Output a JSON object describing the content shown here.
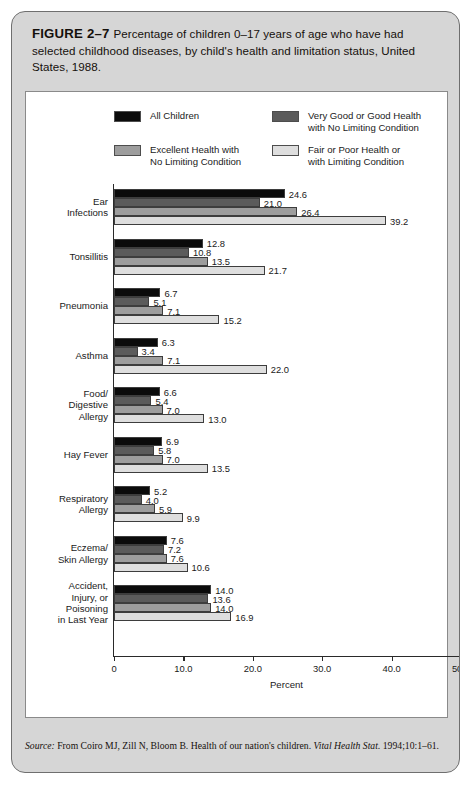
{
  "figure": {
    "number": "FIGURE 2–7",
    "caption": "Percentage of children 0–17 years of age who have had selected childhood diseases, by child's health and limitation status, United States, 1988."
  },
  "source": {
    "label": "Source:",
    "text_before": " From Coiro MJ, Zill N, Bloom B. Health of our nation's children. ",
    "journal": "Vital Health Stat.",
    "text_after": " 1994;10:1–61."
  },
  "chart_data": {
    "type": "bar",
    "orientation": "horizontal",
    "title": "",
    "xlabel": "Percent",
    "ylabel": "",
    "xlim": [
      0,
      50
    ],
    "xticks": [
      "0",
      "10.0",
      "20.0",
      "30.0",
      "40.0",
      "50.0"
    ],
    "xtick_values": [
      0,
      10,
      20,
      30,
      40,
      50
    ],
    "grid": false,
    "legend_position": "top",
    "categories": [
      "Ear Infections",
      "Tonsillitis",
      "Pneumonia",
      "Asthma",
      "Food/ Digestive Allergy",
      "Hay Fever",
      "Respiratory Allergy",
      "Eczema/ Skin Allergy",
      "Accident, Injury, or Poisoning in Last Year"
    ],
    "category_lines": [
      [
        "Ear",
        "Infections"
      ],
      [
        "Tonsillitis"
      ],
      [
        "Pneumonia"
      ],
      [
        "Asthma"
      ],
      [
        "Food/",
        "Digestive",
        "Allergy"
      ],
      [
        "Hay Fever"
      ],
      [
        "Respiratory",
        "Allergy"
      ],
      [
        "Eczema/",
        "Skin Allergy"
      ],
      [
        "Accident,",
        "Injury, or",
        "Poisoning",
        "in Last Year"
      ]
    ],
    "series": [
      {
        "name": "All Children",
        "color": "#0b0b0b",
        "values": [
          24.6,
          12.8,
          6.7,
          6.3,
          6.6,
          6.9,
          5.2,
          7.6,
          14.0
        ],
        "labels": [
          "24.6",
          "12.8",
          "6.7",
          "6.3",
          "6.6",
          "6.9",
          "5.2",
          "7.6",
          "14.0"
        ]
      },
      {
        "name": "Very Good or Good Health with No Limiting Condition",
        "color": "#5b5b5b",
        "values": [
          21.0,
          10.8,
          5.1,
          3.4,
          5.4,
          5.8,
          4.0,
          7.2,
          13.6
        ],
        "labels": [
          "21.0",
          "10.8",
          "5.1",
          "3.4",
          "5.4",
          "5.8",
          "4.0",
          "7.2",
          "13.6"
        ]
      },
      {
        "name": "Excellent Health with No Limiting Condition",
        "color": "#9d9d9d",
        "values": [
          26.4,
          13.5,
          7.1,
          7.1,
          7.0,
          7.0,
          5.9,
          7.6,
          14.0
        ],
        "labels": [
          "26.4",
          "13.5",
          "7.1",
          "7.1",
          "7.0",
          "7.0",
          "5.9",
          "7.6",
          "14.0"
        ]
      },
      {
        "name": "Fair or Poor Health or with Limiting Condition",
        "color": "#dedede",
        "values": [
          39.2,
          21.7,
          15.2,
          22.0,
          13.0,
          13.5,
          9.9,
          10.6,
          16.9
        ],
        "labels": [
          "39.2",
          "21.7",
          "15.2",
          "22.0",
          "13.0",
          "13.5",
          "9.9",
          "10.6",
          "16.9"
        ]
      }
    ]
  },
  "legend": [
    {
      "label_lines": [
        "All Children"
      ],
      "color": "#0b0b0b"
    },
    {
      "label_lines": [
        "Very Good or Good Health",
        "with No Limiting Condition"
      ],
      "color": "#5b5b5b"
    },
    {
      "label_lines": [
        "Excellent Health with",
        "No Limiting Condition"
      ],
      "color": "#9d9d9d"
    },
    {
      "label_lines": [
        "Fair or Poor Health or",
        "with Limiting Condition"
      ],
      "color": "#dedede"
    }
  ]
}
